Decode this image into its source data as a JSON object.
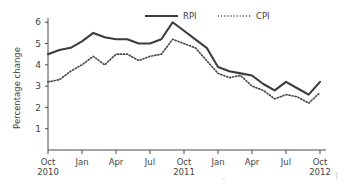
{
  "chart_data": {
    "type": "line",
    "title": "",
    "subtitle": "",
    "xlabel": "",
    "ylabel": "Percentage change",
    "ylim": [
      0,
      6.2
    ],
    "yticks": [
      1,
      2,
      3,
      4,
      5,
      6
    ],
    "ytick_labels": [
      "1",
      "2",
      "3",
      "4",
      "5",
      "6"
    ],
    "grid": false,
    "legend_position": "top-center",
    "x": [
      "Oct 2010",
      "Nov 2010",
      "Dec 2010",
      "Jan 2011",
      "Feb 2011",
      "Mar 2011",
      "Apr 2011",
      "May 2011",
      "Jun 2011",
      "Jul 2011",
      "Aug 2011",
      "Sep 2011",
      "Oct 2011",
      "Nov 2011",
      "Dec 2011",
      "Jan 2012",
      "Feb 2012",
      "Mar 2012",
      "Apr 2012",
      "May 2012",
      "Jun 2012",
      "Jul 2012",
      "Aug 2012",
      "Sep 2012",
      "Oct 2012"
    ],
    "xticks": [
      "Oct",
      "Jan",
      "Apr",
      "Jul",
      "Oct",
      "Jan",
      "Apr",
      "Jul",
      "Oct"
    ],
    "xtick_years": [
      "2010",
      "",
      "",
      "",
      "2011",
      "",
      "",
      "",
      "2012"
    ],
    "xtick_indices": [
      0,
      3,
      6,
      9,
      12,
      15,
      18,
      21,
      24
    ],
    "series": [
      {
        "name": "RPI",
        "style": "solid",
        "color": "#3c3c3c",
        "values": [
          4.5,
          4.7,
          4.8,
          5.1,
          5.5,
          5.3,
          5.2,
          5.2,
          5.0,
          5.0,
          5.2,
          6.0,
          5.6,
          5.2,
          4.8,
          3.9,
          3.7,
          3.6,
          3.5,
          3.1,
          2.8,
          3.2,
          2.9,
          2.6,
          3.2
        ]
      },
      {
        "name": "CPI",
        "style": "dotted",
        "color": "#4a4a4a",
        "values": [
          3.2,
          3.3,
          3.7,
          4.0,
          4.4,
          4.0,
          4.5,
          4.5,
          4.2,
          4.4,
          4.5,
          5.2,
          5.0,
          4.8,
          4.2,
          3.6,
          3.4,
          3.5,
          3.0,
          2.8,
          2.4,
          2.6,
          2.5,
          2.2,
          2.7
        ]
      }
    ],
    "legend": [
      {
        "label": "RPI",
        "style": "solid"
      },
      {
        "label": "CPI",
        "style": "dotted"
      }
    ]
  }
}
